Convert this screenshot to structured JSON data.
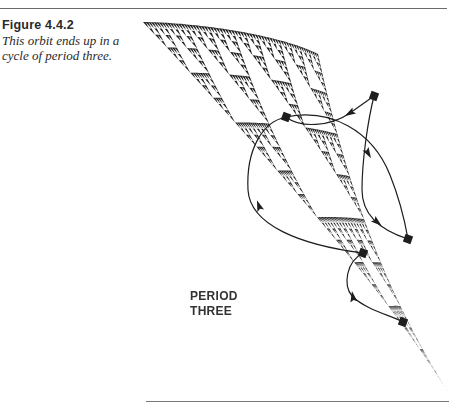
{
  "caption": {
    "label": "Figure  4.4.2",
    "text_line1": "This orbit ends up in a",
    "text_line2": "cycle of period three."
  },
  "figure": {
    "annotation_line1": "PERIOD",
    "annotation_line2": "THREE",
    "ink_color": "#1e1e1e",
    "fractal": {
      "type": "sierpinski-like IFS attractor (curved)",
      "corners": {
        "top_left": [
          143,
          22
        ],
        "top_right": [
          318,
          24
        ],
        "bottom_tip": [
          448,
          392
        ]
      },
      "depth": 6
    },
    "orbit_points": [
      {
        "id": "A",
        "x": 286,
        "y": 117
      },
      {
        "id": "B",
        "x": 374,
        "y": 96
      },
      {
        "id": "C",
        "x": 408,
        "y": 239
      },
      {
        "id": "D",
        "x": 363,
        "y": 253
      },
      {
        "id": "E",
        "x": 403,
        "y": 322
      }
    ],
    "orbit_paths": [
      {
        "from": "A",
        "to": "C",
        "d": "M286,117 C330,108 372,130 390,175 C400,200 405,222 408,239",
        "arrow_at": [
          368,
          153
        ],
        "arrow_angle": 60
      },
      {
        "from": "B",
        "to": "A",
        "d": "M374,96 L350,113 C330,127 300,128 286,117",
        "arrow_at": [
          350,
          113
        ],
        "arrow_angle": 150
      },
      {
        "from": "B",
        "to": "C",
        "d": "M374,96 C368,120 362,160 362,190 C362,215 380,230 408,239",
        "arrow_at": [
          377,
          222
        ],
        "arrow_angle": 40
      },
      {
        "from": "A",
        "to": "D",
        "d": "M286,117 C262,122 246,150 248,190 C250,225 300,245 363,253",
        "arrow_at": [
          259,
          206
        ],
        "arrow_angle": -110
      },
      {
        "from": "D",
        "to": "E",
        "d": "M363,253 C346,262 343,285 352,296 C366,310 390,315 403,322",
        "arrow_at": [
          353,
          297
        ],
        "arrow_angle": -100
      }
    ]
  }
}
